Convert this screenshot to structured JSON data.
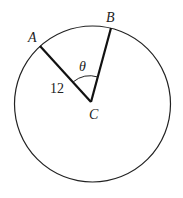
{
  "diagram": {
    "type": "circle-sector",
    "points": {
      "A": {
        "label": "A"
      },
      "B": {
        "label": "B"
      },
      "C": {
        "label": "C",
        "role": "center"
      }
    },
    "segments": [
      {
        "from": "C",
        "to": "A",
        "length_label": "12"
      },
      {
        "from": "C",
        "to": "B"
      }
    ],
    "angle": {
      "vertex": "C",
      "label": "θ"
    }
  }
}
